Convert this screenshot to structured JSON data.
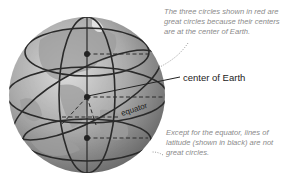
{
  "diagram": {
    "labels": {
      "center": "center of Earth",
      "equator": "equator"
    },
    "notes": {
      "top": [
        "The three circles shown in red are",
        "great circles because their centers",
        "are at the center of Earth."
      ],
      "bottom": [
        "Except for the equator, lines of",
        "latitude (shown in black) are not",
        "great circles."
      ]
    },
    "colors": {
      "globe_light": "#d2d2d2",
      "globe_dark": "#6e6e6e",
      "land": "#a4a4a4",
      "lines": "#2a2a2a",
      "note_text": "#8a8a8a",
      "pointer": "#9a9a9a"
    }
  }
}
